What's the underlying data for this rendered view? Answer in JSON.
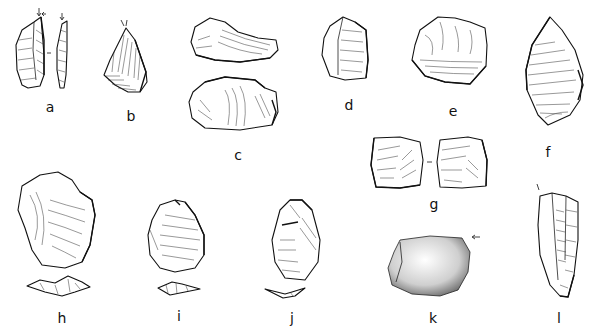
{
  "figure": {
    "ink_color": "#111111",
    "background": "#ffffff",
    "artifacts": [
      {
        "id": "a",
        "label": "a",
        "views": 2,
        "note": "blade with two views, arrows at top",
        "label_pos": [
          50,
          107
        ]
      },
      {
        "id": "b",
        "label": "b",
        "views": 1,
        "note": "triangular flake with arrow at tip",
        "label_pos": [
          131,
          116
        ]
      },
      {
        "id": "c",
        "label": "c",
        "views": 2,
        "note": "scraper, two stacked views",
        "label_pos": [
          238,
          155
        ]
      },
      {
        "id": "d",
        "label": "d",
        "views": 1,
        "note": "flake",
        "label_pos": [
          349,
          105
        ]
      },
      {
        "id": "e",
        "label": "e",
        "views": 1,
        "note": "core / denticulate",
        "label_pos": [
          453,
          111
        ]
      },
      {
        "id": "f",
        "label": "f",
        "views": 1,
        "note": "pointed flake",
        "label_pos": [
          548,
          152
        ]
      },
      {
        "id": "g",
        "label": "g",
        "views": 2,
        "note": "two faces of a square flake",
        "label_pos": [
          434,
          204
        ]
      },
      {
        "id": "h",
        "label": "h",
        "views": 2,
        "note": "flake with cross-section below",
        "label_pos": [
          62,
          318
        ]
      },
      {
        "id": "i",
        "label": "i",
        "views": 2,
        "note": "flake with cross-section below",
        "label_pos": [
          179,
          316
        ]
      },
      {
        "id": "j",
        "label": "j",
        "views": 2,
        "note": "flake with cross-section below",
        "label_pos": [
          292,
          318
        ]
      },
      {
        "id": "k",
        "label": "k",
        "views": 1,
        "note": "cortical (stippled) piece with arrow",
        "label_pos": [
          433,
          318
        ]
      },
      {
        "id": "l",
        "label": "l",
        "views": 1,
        "note": "blade with arrow at top",
        "label_pos": [
          559,
          318
        ]
      }
    ]
  }
}
